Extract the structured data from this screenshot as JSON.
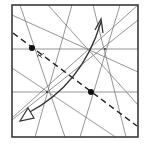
{
  "diagram": {
    "type": "origami-crease-diagram",
    "colors": {
      "background": "#ffffff",
      "border": "#3a3a3a",
      "crease": "#7a7a7a",
      "dashed": "#222222",
      "arrow": "#333333",
      "dot": "#111111"
    },
    "square": {
      "x": 12,
      "y": 5,
      "width": 126,
      "height": 132
    },
    "hubs": [
      {
        "name": "left-hub",
        "x": 47,
        "y": 92
      },
      {
        "name": "right-hub",
        "x": 105,
        "y": 49
      }
    ],
    "reference_points": [
      {
        "name": "upper-left-dot",
        "x": 32,
        "y": 48
      },
      {
        "name": "lower-right-dot",
        "x": 91,
        "y": 92
      }
    ],
    "fold_arrow": {
      "from": [
        22,
        118
      ],
      "to": [
        101,
        20
      ],
      "head_start": "hollow",
      "head_end": "open"
    },
    "angle_mark": {
      "at": [
        32,
        48
      ],
      "label": "angle-bisector-mark"
    }
  }
}
